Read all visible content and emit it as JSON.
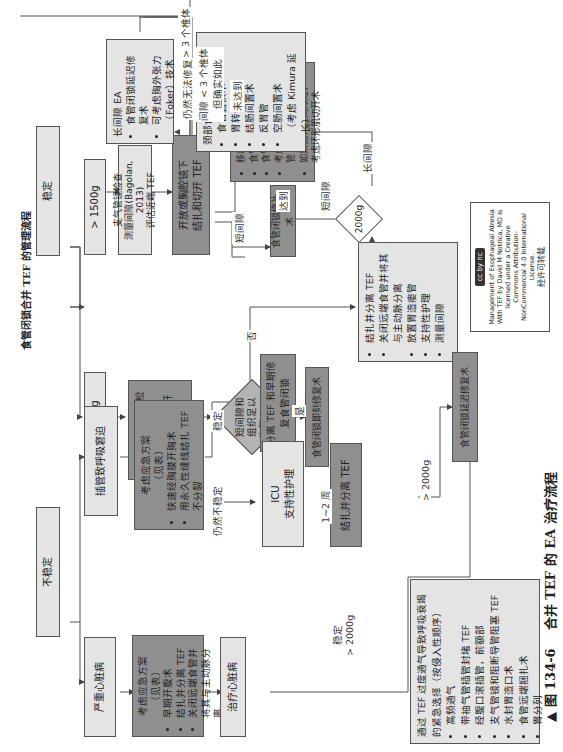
{
  "figure": {
    "heading": "食管闭锁合并 TEF 的管理流程",
    "caption_marker": "▲",
    "caption_number": "图 134-6",
    "caption_text": "合并 TEF 的 EA 治疗流程"
  },
  "nodes": {
    "stable": "稳定",
    "unstable": "不稳定",
    "over1500": "> 1500g",
    "under1500": "< 1500g",
    "bronchoscopy_eval": "支气管镜检查\n测量间隙(Bagolan, 2013)\n评估近端 TEF",
    "open_thoracoscopic": "开放或胸腔镜下\n结扎和切开 TEF",
    "small_lt1500_steps": [
      "1. 考虑支气管镜检查",
      "2.TEF 胸膜外切开闭合术"
    ],
    "gap_decision": "短间隙和\n组织足以\n修复 EA ?",
    "yes": "是",
    "no": "否",
    "immediate_repair": "食管闭锁即刻修复术",
    "primary_repair": "食管闭锁修补术",
    "gap_techniques": [
      "移动近端食管",
      "食管远端活动",
      "食管前皮瓣（Gough）",
      "考虑部胸切口来移动食管",
      "如果能，但间隙短，",
      "考虑环形肌切开术"
    ],
    "long_gap_ea_title": "长间隙 EA",
    "long_gap_ea_items": [
      "食管闭锁延迟修复术",
      "可考虑胸外张力（Foker）技术"
    ],
    "still_unrepairable": "仍然无法修复",
    "cervical_options_title": "颈部食管造口术后",
    "cervical_options": [
      "食管置换术",
      "胃转位",
      "结肠间置术",
      "反胃管",
      "空肠间置术",
      "（考虑 Kimura 延长）"
    ],
    "ligate_divide_items": [
      "结扎并分离 TEF",
      "关闭远端食管并将其与主动脉分离",
      "放置胃造瘘管",
      "支持性护理",
      "测量间隙"
    ],
    "weight_2000": "2000g",
    "resp_distress": "插管致呼吸窘迫",
    "emergency_plan_1_title": "考虑应急方案\n（见表）",
    "emergency_plan_1_items": [
      "快速经胸膜开胸术",
      "用永久性缝线结扎 TEF 不分裂"
    ],
    "split_tef_early": "分离 TEF 和早期修复食管闭锁",
    "icu_support": "ICU\n支持性护理",
    "ligate_tef": "结扎并分离 TEF",
    "delayed_repair": "食管闭锁延迟修复术",
    "cardiac_severe": "严重心脏病",
    "emergency_plan_2_title": "考虑应急方案\n（见表）",
    "emergency_plan_2_items": [
      "早期开腹术",
      "结扎并分离 TEF",
      "关闭远端食管并将其与主动脉分离"
    ],
    "treat_cardiac": "治疗心脏病",
    "excessive_vent_title": "通过 TEF 过度通气导致呼吸衰竭的紧急选择（按侵入性顺序）",
    "excessive_vent_items": [
      "高频通气",
      "带袖气管插管封堵 TEF",
      "经腹口滚插管，前额部",
      "支气管镜和阻断导管阻塞 TEF",
      "水封胃造口术",
      "食管远端捆扎术",
      "胃分列"
    ]
  },
  "edge_labels": {
    "gap_gt3": "间隙 > 3 个椎体",
    "gap_lt3": "间隙 < 3 个椎体\n但确实如此",
    "short_gap_1": "短间隙",
    "short_gap_2": "短间隙",
    "long_gap": "长间隙",
    "reached": "达到",
    "not_reached": "未达到",
    "stable_branch": "稳定",
    "still_unstable": "仍然不稳定",
    "weeks": "1~2 周",
    "gt2000_a": "> 2000g",
    "stable_gt2000": "稳定\n> 2000g"
  },
  "license": {
    "badge": "cc by nc",
    "text": "Management of Esophageal Atresia With TEF by David M Notrica, MD is licensed under a Creative Commons Attribution-NonCommercial 4.0 International License.",
    "note": "经许可转载"
  }
}
